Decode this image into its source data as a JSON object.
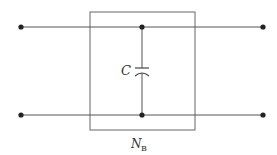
{
  "diagram": {
    "type": "two-port network",
    "network_label": "N",
    "network_label_subscript": "B",
    "capacitor_label": "C",
    "colors": {
      "line": "#555555",
      "node": "#222222",
      "background": "#ffffff"
    },
    "terminals": [
      "top-left",
      "bottom-left",
      "top-right",
      "bottom-right"
    ],
    "components": [
      {
        "type": "capacitor",
        "label": "C",
        "connection": "shunt between top and bottom wires"
      }
    ]
  }
}
